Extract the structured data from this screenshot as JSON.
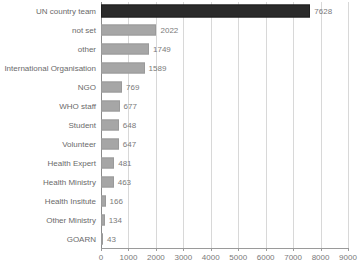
{
  "chart_data": {
    "type": "bar",
    "orientation": "horizontal",
    "title": "",
    "xlabel": "",
    "ylabel": "",
    "xlim": [
      0,
      9000
    ],
    "xticks": [
      0,
      1000,
      2000,
      3000,
      4000,
      5000,
      6000,
      7000,
      8000,
      9000
    ],
    "xtick_labels": [
      "0",
      "1000",
      "2000",
      "3000",
      "4000",
      "5000",
      "6000",
      "7000",
      "8000",
      "9000"
    ],
    "grid": true,
    "legend": null,
    "categories": [
      "UN country team",
      "not set",
      "other",
      "International Organisation",
      "NGO",
      "WHO staff",
      "Student",
      "Volunteer",
      "Health Expert",
      "Health Ministry",
      "Health Insitute",
      "Other Ministry",
      "GOARN"
    ],
    "values": [
      7628,
      2022,
      1749,
      1589,
      769,
      677,
      648,
      647,
      481,
      463,
      166,
      134,
      43
    ],
    "value_labels": [
      "7628",
      "2022",
      "1749",
      "1589",
      "769",
      "677",
      "648",
      "647",
      "481",
      "463",
      "166",
      "134",
      "43"
    ],
    "highlight_index": 0,
    "colors": {
      "bar": "#a6a6a6",
      "bar_highlight": "#2b2b2b",
      "grid": "#d8d8d8",
      "axis": "#9a9a9a",
      "text": "#6a6a6a",
      "background": "#ffffff"
    }
  }
}
